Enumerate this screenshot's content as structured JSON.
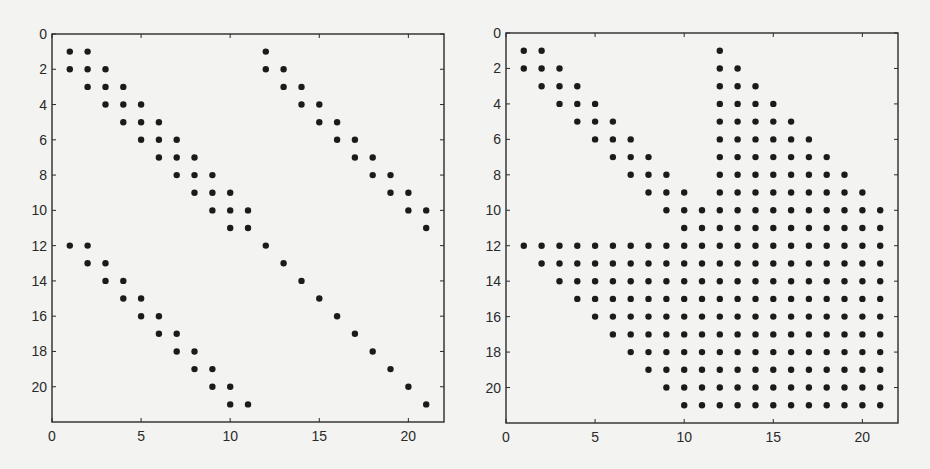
{
  "figure": {
    "background": "#f3f3f1",
    "dot_color": "#1b1b1b",
    "axis_color": "#2a2a2a"
  },
  "chart_data": [
    {
      "type": "scatter",
      "subtype": "sparsity-pattern",
      "title": "",
      "xlabel": "",
      "ylabel": "",
      "xlim": [
        0,
        22
      ],
      "ylim": [
        22,
        0
      ],
      "y_inverted": true,
      "grid": false,
      "xticks": [
        0,
        5,
        10,
        15,
        20
      ],
      "yticks": [
        0,
        2,
        4,
        6,
        8,
        10,
        12,
        14,
        16,
        18,
        20
      ],
      "description": "Nonzero pattern of a 21x21 matrix: tridiagonal block (rows 1-11, cols 1-11), bidiagonal upper-right block, bidiagonal lower-left block, diagonal lower-right block",
      "rows": [
        {
          "row": 1,
          "cols": [
            1,
            2,
            12
          ]
        },
        {
          "row": 2,
          "cols": [
            1,
            2,
            3,
            12,
            13
          ]
        },
        {
          "row": 3,
          "cols": [
            2,
            3,
            4,
            13,
            14
          ]
        },
        {
          "row": 4,
          "cols": [
            3,
            4,
            5,
            14,
            15
          ]
        },
        {
          "row": 5,
          "cols": [
            4,
            5,
            6,
            15,
            16
          ]
        },
        {
          "row": 6,
          "cols": [
            5,
            6,
            7,
            16,
            17
          ]
        },
        {
          "row": 7,
          "cols": [
            6,
            7,
            8,
            17,
            18
          ]
        },
        {
          "row": 8,
          "cols": [
            7,
            8,
            9,
            18,
            19
          ]
        },
        {
          "row": 9,
          "cols": [
            8,
            9,
            10,
            19,
            20
          ]
        },
        {
          "row": 10,
          "cols": [
            9,
            10,
            11,
            20,
            21
          ]
        },
        {
          "row": 11,
          "cols": [
            10,
            11,
            21
          ]
        },
        {
          "row": 12,
          "cols": [
            1,
            2,
            12
          ]
        },
        {
          "row": 13,
          "cols": [
            2,
            3,
            13
          ]
        },
        {
          "row": 14,
          "cols": [
            3,
            4,
            14
          ]
        },
        {
          "row": 15,
          "cols": [
            4,
            5,
            15
          ]
        },
        {
          "row": 16,
          "cols": [
            5,
            6,
            16
          ]
        },
        {
          "row": 17,
          "cols": [
            6,
            7,
            17
          ]
        },
        {
          "row": 18,
          "cols": [
            7,
            8,
            18
          ]
        },
        {
          "row": 19,
          "cols": [
            8,
            9,
            19
          ]
        },
        {
          "row": 20,
          "cols": [
            9,
            10,
            20
          ]
        },
        {
          "row": 21,
          "cols": [
            10,
            11,
            21
          ]
        }
      ]
    },
    {
      "type": "scatter",
      "subtype": "sparsity-pattern",
      "title": "",
      "xlabel": "",
      "ylabel": "",
      "xlim": [
        0,
        22
      ],
      "ylim": [
        22,
        0
      ],
      "y_inverted": true,
      "grid": false,
      "xticks": [
        0,
        5,
        10,
        15,
        20
      ],
      "yticks": [
        0,
        2,
        4,
        6,
        8,
        10,
        12,
        14,
        16,
        18,
        20
      ],
      "description": "Nonzero pattern (fill-in) of a 21x21 matrix: tridiagonal block in rows 1-11, filled upper-right triangle/block, and filled lower staircase in rows 12-21",
      "rows": [
        {
          "row": 1,
          "cols": [
            1,
            2,
            12
          ]
        },
        {
          "row": 2,
          "cols": [
            1,
            2,
            3,
            12,
            13
          ]
        },
        {
          "row": 3,
          "cols": [
            2,
            3,
            4,
            12,
            13,
            14
          ]
        },
        {
          "row": 4,
          "cols": [
            3,
            4,
            5,
            12,
            13,
            14,
            15
          ]
        },
        {
          "row": 5,
          "cols": [
            4,
            5,
            6,
            12,
            13,
            14,
            15,
            16
          ]
        },
        {
          "row": 6,
          "cols": [
            5,
            6,
            7,
            12,
            13,
            14,
            15,
            16,
            17
          ]
        },
        {
          "row": 7,
          "cols": [
            6,
            7,
            8,
            12,
            13,
            14,
            15,
            16,
            17,
            18
          ]
        },
        {
          "row": 8,
          "cols": [
            7,
            8,
            9,
            12,
            13,
            14,
            15,
            16,
            17,
            18,
            19
          ]
        },
        {
          "row": 9,
          "cols": [
            8,
            9,
            10,
            12,
            13,
            14,
            15,
            16,
            17,
            18,
            19,
            20
          ]
        },
        {
          "row": 10,
          "cols": [
            9,
            10,
            11,
            12,
            13,
            14,
            15,
            16,
            17,
            18,
            19,
            20,
            21
          ]
        },
        {
          "row": 11,
          "cols": [
            10,
            11,
            12,
            13,
            14,
            15,
            16,
            17,
            18,
            19,
            20,
            21
          ]
        },
        {
          "row": 12,
          "cols": [
            1,
            2,
            3,
            4,
            5,
            6,
            7,
            8,
            9,
            10,
            11,
            12,
            13,
            14,
            15,
            16,
            17,
            18,
            19,
            20,
            21
          ]
        },
        {
          "row": 13,
          "cols": [
            2,
            3,
            4,
            5,
            6,
            7,
            8,
            9,
            10,
            11,
            12,
            13,
            14,
            15,
            16,
            17,
            18,
            19,
            20,
            21
          ]
        },
        {
          "row": 14,
          "cols": [
            3,
            4,
            5,
            6,
            7,
            8,
            9,
            10,
            11,
            12,
            13,
            14,
            15,
            16,
            17,
            18,
            19,
            20,
            21
          ]
        },
        {
          "row": 15,
          "cols": [
            4,
            5,
            6,
            7,
            8,
            9,
            10,
            11,
            12,
            13,
            14,
            15,
            16,
            17,
            18,
            19,
            20,
            21
          ]
        },
        {
          "row": 16,
          "cols": [
            5,
            6,
            7,
            8,
            9,
            10,
            11,
            12,
            13,
            14,
            15,
            16,
            17,
            18,
            19,
            20,
            21
          ]
        },
        {
          "row": 17,
          "cols": [
            6,
            7,
            8,
            9,
            10,
            11,
            12,
            13,
            14,
            15,
            16,
            17,
            18,
            19,
            20,
            21
          ]
        },
        {
          "row": 18,
          "cols": [
            7,
            8,
            9,
            10,
            11,
            12,
            13,
            14,
            15,
            16,
            17,
            18,
            19,
            20,
            21
          ]
        },
        {
          "row": 19,
          "cols": [
            8,
            9,
            10,
            11,
            12,
            13,
            14,
            15,
            16,
            17,
            18,
            19,
            20,
            21
          ]
        },
        {
          "row": 20,
          "cols": [
            9,
            10,
            11,
            12,
            13,
            14,
            15,
            16,
            17,
            18,
            19,
            20,
            21
          ]
        },
        {
          "row": 21,
          "cols": [
            10,
            11,
            12,
            13,
            14,
            15,
            16,
            17,
            18,
            19,
            20,
            21
          ]
        }
      ]
    }
  ],
  "layout": {
    "panels": [
      {
        "left": 52,
        "top": 34,
        "right": 444,
        "bottom": 422
      },
      {
        "left": 506,
        "top": 33,
        "right": 898,
        "bottom": 423
      }
    ]
  }
}
